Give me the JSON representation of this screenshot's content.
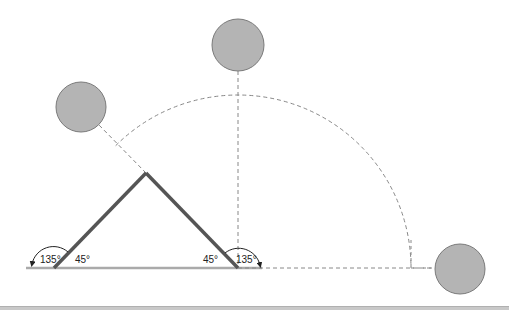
{
  "diagram": {
    "type": "geometry-angle-diagram",
    "colors": {
      "rod": "#555555",
      "ground": "#aaaaaa",
      "dashed": "#888888",
      "ball_fill": "#b4b4b4",
      "ball_stroke": "#7a7a7a",
      "arrow": "#222222"
    },
    "labels": {
      "left_obtuse": "135°",
      "left_acute": "45°",
      "right_acute": "45°",
      "right_obtuse": "135°"
    },
    "balls": [
      {
        "name": "ball-135-position",
        "cx": 81,
        "cy": 107,
        "r": 25
      },
      {
        "name": "ball-90-position",
        "cx": 238,
        "cy": 45,
        "r": 26
      },
      {
        "name": "ball-0-position",
        "cx": 460,
        "cy": 269,
        "r": 25
      }
    ],
    "rods": {
      "apex": [
        146,
        173
      ],
      "left_base": [
        54,
        268
      ],
      "right_base": [
        238,
        268
      ]
    },
    "arc": {
      "center": [
        238,
        268
      ],
      "radius": 173,
      "start_deg": 135,
      "end_deg": 0
    }
  }
}
